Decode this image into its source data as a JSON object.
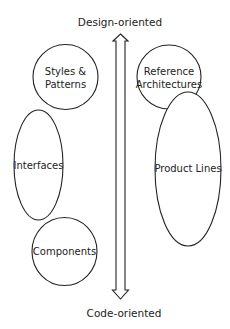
{
  "diagram": {
    "axis": {
      "top_label": "Design-oriented",
      "bottom_label": "Code-oriented",
      "direction": "bidirectional-vertical"
    },
    "nodes": [
      {
        "id": "styles",
        "label_lines": [
          "Styles &",
          "Patterns"
        ],
        "shape": "circle",
        "column": "left"
      },
      {
        "id": "interfaces",
        "label_lines": [
          "Interfaces"
        ],
        "shape": "ellipse",
        "column": "left"
      },
      {
        "id": "components",
        "label_lines": [
          "Components"
        ],
        "shape": "circle",
        "column": "left"
      },
      {
        "id": "reference",
        "label_lines": [
          "Reference",
          "Architectures"
        ],
        "shape": "circle",
        "column": "right"
      },
      {
        "id": "product-lines",
        "label_lines": [
          "Product Lines"
        ],
        "shape": "ellipse",
        "column": "right"
      }
    ],
    "colors": {
      "stroke": "#222222",
      "fill": "#ffffff",
      "text": "#222222"
    }
  }
}
